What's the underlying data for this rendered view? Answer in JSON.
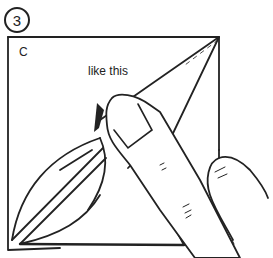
{
  "illustration": {
    "step_number": "3",
    "corner_label": "C",
    "instruction": "like this",
    "stroke_color": "#222222",
    "background_color": "#ffffff"
  }
}
